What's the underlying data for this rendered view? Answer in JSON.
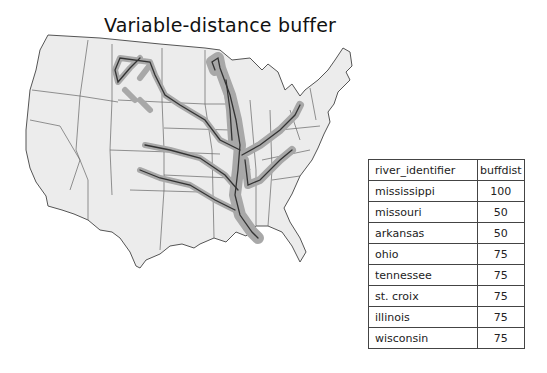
{
  "title": "Variable-distance buffer",
  "colors": {
    "land": "#ececec",
    "state_border": "#555555",
    "buffer": "#a8a8a8",
    "river": "#333333"
  },
  "table": {
    "headers": [
      "river_identifier",
      "buffdist"
    ],
    "rows": [
      {
        "river_identifier": "mississippi",
        "buffdist": "100"
      },
      {
        "river_identifier": "missouri",
        "buffdist": "50"
      },
      {
        "river_identifier": "arkansas",
        "buffdist": "50"
      },
      {
        "river_identifier": "ohio",
        "buffdist": "75"
      },
      {
        "river_identifier": "tennessee",
        "buffdist": "75"
      },
      {
        "river_identifier": "st. croix",
        "buffdist": "75"
      },
      {
        "river_identifier": "illinois",
        "buffdist": "75"
      },
      {
        "river_identifier": "wisconsin",
        "buffdist": "75"
      }
    ]
  }
}
